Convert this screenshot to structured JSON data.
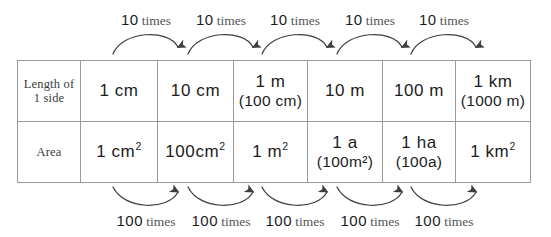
{
  "diagram": {
    "title_text": "Metric length and area unit conversion table",
    "rows": [
      {
        "label_lines": [
          "Length of",
          "1 side"
        ],
        "label_name": "length-of-one-side",
        "cells": [
          {
            "main": "1 cm",
            "sub": ""
          },
          {
            "main": "10 cm",
            "sub": ""
          },
          {
            "main": "1 m",
            "sub": "(100 cm)"
          },
          {
            "main": "10 m",
            "sub": ""
          },
          {
            "main": "100 m",
            "sub": ""
          },
          {
            "main": "1 km",
            "sub": "(1000 m)"
          }
        ]
      },
      {
        "label_lines": [
          "Area"
        ],
        "label_name": "area",
        "cells": [
          {
            "main": "1 cm",
            "sup": "2",
            "sub": ""
          },
          {
            "main": "100cm",
            "sup": "2",
            "sub": ""
          },
          {
            "main": "1 m",
            "sup": "2",
            "sub": ""
          },
          {
            "main": "1 a",
            "sup": "",
            "sub": "(100m²)"
          },
          {
            "main": "1 ha",
            "sup": "",
            "sub": "(100a)"
          },
          {
            "main": "1 km",
            "sup": "2",
            "sub": ""
          }
        ]
      }
    ],
    "top_arrows": [
      {
        "num": "10",
        "word": "times"
      },
      {
        "num": "10",
        "word": "times"
      },
      {
        "num": "10",
        "word": "times"
      },
      {
        "num": "10",
        "word": "times"
      },
      {
        "num": "10",
        "word": "times"
      }
    ],
    "bottom_arrows": [
      {
        "num": "100",
        "word": "times"
      },
      {
        "num": "100",
        "word": "times"
      },
      {
        "num": "100",
        "word": "times"
      },
      {
        "num": "100",
        "word": "times"
      },
      {
        "num": "100",
        "word": "times"
      }
    ],
    "colors": {
      "border": "#9a9a9a",
      "text": "#1c1c1c",
      "label_text": "#4a4a4a",
      "arrow_stroke": "#3d3d3d",
      "background": "#ffffff"
    }
  }
}
